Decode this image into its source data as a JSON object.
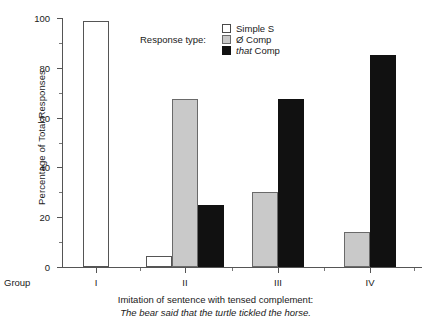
{
  "chart_data": {
    "type": "bar",
    "title": "",
    "xlabel": "Group",
    "ylabel": "Percentage of Total Responses",
    "ylim": [
      0,
      100
    ],
    "ytick_step": 20,
    "yticks": [
      0,
      20,
      40,
      60,
      80,
      100
    ],
    "yminor_step": 10,
    "grid": false,
    "legend_title": "Response type:",
    "legend_position": "top-center",
    "categories": [
      "I",
      "II",
      "III",
      "IV"
    ],
    "series": [
      {
        "name": "Simple S",
        "label_plain": "Simple S",
        "label_italic": "",
        "color": "#ffffff",
        "values": [
          99,
          4.5,
          0,
          0
        ]
      },
      {
        "name": "Zero Comp",
        "label_plain": "Ø Comp",
        "label_italic": "",
        "color": "#c9c9c9",
        "values": [
          0,
          67.5,
          30,
          14
        ]
      },
      {
        "name": "that Comp",
        "label_plain": " Comp",
        "label_italic": "that",
        "color": "#111111",
        "values": [
          0,
          25,
          67.5,
          85
        ]
      }
    ],
    "caption_line1": "Imitation of sentence with tensed complement:",
    "caption_line2": "The bear said that the turtle tickled the horse."
  },
  "axis": {
    "group_word": "Group"
  }
}
